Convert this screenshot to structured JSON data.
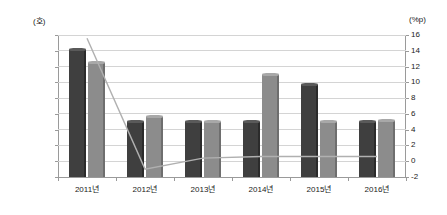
{
  "chart_data": {
    "type": "bar",
    "title": "",
    "subtitle": "",
    "xlabel": "",
    "ylabel": "(호)",
    "y2label": "(%p)",
    "categories": [
      "2011년",
      "2012년",
      "2013년",
      "2014년",
      "2015년",
      "2016년"
    ],
    "series": [
      {
        "name": "series-1",
        "kind": "bar",
        "axis": "left",
        "color": "#3f3f3f",
        "values": [
          16100,
          7000,
          7000,
          7000,
          11700,
          7000
        ]
      },
      {
        "name": "series-2",
        "kind": "bar",
        "axis": "left",
        "color": "#8c8c8c",
        "values": [
          14500,
          7600,
          7000,
          12900,
          7000,
          7100
        ]
      },
      {
        "name": "series-3",
        "kind": "line",
        "axis": "right",
        "color": "#b0b0b0",
        "values": [
          15.6,
          -1.0,
          0.4,
          0.6,
          0.6,
          0.6
        ]
      }
    ],
    "ylim": [
      0,
      18000
    ],
    "yticks": [
      0,
      2000,
      4000,
      6000,
      8000,
      10000,
      12000,
      14000,
      16000,
      18000
    ],
    "ytick_labels": [
      "0",
      "2000",
      "4000",
      "6000",
      "8000",
      "10000",
      "12000",
      "14000",
      "16000",
      "18000"
    ],
    "y2lim": [
      -2,
      16
    ],
    "y2ticks": [
      -2,
      0,
      2,
      4,
      6,
      8,
      10,
      12,
      14,
      16
    ],
    "y2tick_labels": [
      "-2",
      "0",
      "2",
      "4",
      "6",
      "8",
      "10",
      "12",
      "14",
      "16"
    ],
    "grid": true,
    "legend": "none",
    "annotations": []
  }
}
